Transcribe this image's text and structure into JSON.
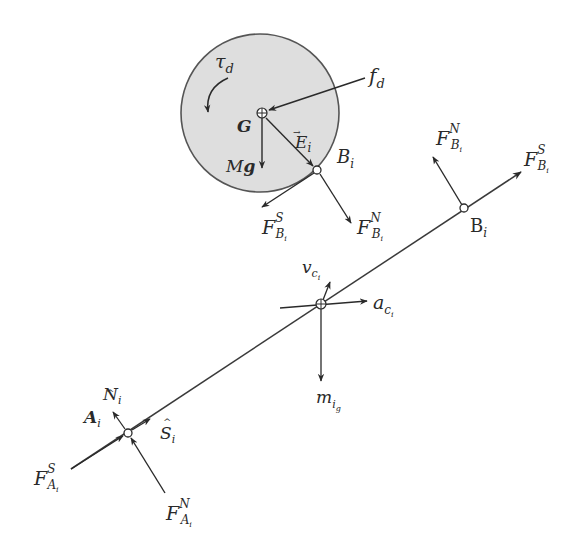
{
  "diagram": {
    "type": "free-body diagram",
    "colors": {
      "line": "#3a3a3a",
      "wheel_fill": "#dedede",
      "wheel_stroke": "#555555",
      "background": "#ffffff"
    },
    "wheel": {
      "center_label": "G",
      "torque": {
        "main": "τ",
        "sub": "d"
      },
      "drag_force": {
        "main": "f",
        "sub": "d"
      },
      "weight": {
        "main": "M",
        "bold": "g"
      },
      "position_vector": {
        "main": "E",
        "sub": "i",
        "accent": "→"
      },
      "contact_point": {
        "main": "B",
        "sub": "i"
      },
      "contact_shear": {
        "main": "F",
        "sup": "S",
        "sub": "B",
        "subsub": "i"
      },
      "contact_normal": {
        "main": "F",
        "sup": "N",
        "sub": "B",
        "subsub": "i"
      }
    },
    "link": {
      "end_b": {
        "point": {
          "main": "B",
          "sub": "i"
        },
        "normal": {
          "main": "F",
          "sup": "N",
          "sub": "B",
          "subsub": "i"
        },
        "shear": {
          "main": "F",
          "sup": "S",
          "sub": "B",
          "subsub": "i"
        }
      },
      "center": {
        "velocity": {
          "main": "v",
          "sub": "c",
          "subsub": "i"
        },
        "acceleration": {
          "main": "a",
          "sub": "c",
          "subsub": "i"
        },
        "weight": {
          "main": "m",
          "sub": "i",
          "subsub": "g"
        }
      },
      "end_a": {
        "point": {
          "main": "A",
          "sub": "i"
        },
        "unit_normal": {
          "main": "N",
          "sub": "i",
          "accent": "^"
        },
        "unit_tangent": {
          "main": "S",
          "sub": "i",
          "accent": "^"
        },
        "shear": {
          "main": "F",
          "sup": "S",
          "sub": "A",
          "subsub": "i"
        },
        "normal": {
          "main": "F",
          "sup": "N",
          "sub": "A",
          "subsub": "i"
        }
      }
    }
  }
}
